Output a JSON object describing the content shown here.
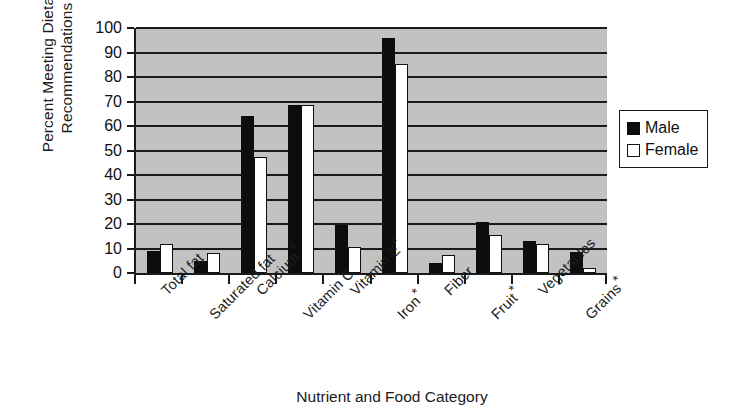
{
  "chart_data": {
    "type": "bar",
    "title": "",
    "xlabel": "Nutrient and Food Category",
    "ylabel": "Percent Meeting Dietary\nRecommendations",
    "ylim": [
      0,
      100
    ],
    "ytick_step": 10,
    "yticks": [
      "100",
      "90",
      "80",
      "70",
      "60",
      "50",
      "40",
      "30",
      "20",
      "10",
      "0"
    ],
    "grid": true,
    "legend_position": "right",
    "categories": [
      "Total fat",
      "Saturated fat",
      "Calcium*",
      "Vitamin C",
      "Vitamin E*",
      "Iron*",
      "Fiber",
      "Fruit*",
      "Vegetables",
      "Grains*"
    ],
    "series": [
      {
        "name": "Male",
        "values": [
          9,
          5,
          64,
          68.5,
          19.5,
          96,
          4,
          21,
          13,
          8.5
        ]
      },
      {
        "name": "Female",
        "values": [
          12,
          8,
          47.5,
          68.5,
          10.5,
          85.5,
          7.5,
          15.5,
          12,
          2
        ]
      }
    ]
  },
  "legend": {
    "items": [
      {
        "label": "Male",
        "color": "#0d0d0d"
      },
      {
        "label": "Female",
        "color": "#ffffff"
      }
    ]
  },
  "colors": {
    "plot_background": "#c2c2c2",
    "axis": "#1a1a1a",
    "male_bar": "#0d0d0d",
    "female_bar": "#ffffff",
    "page_background": "#ffffff"
  }
}
